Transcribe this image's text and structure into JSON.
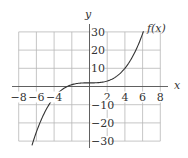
{
  "chart_data": {
    "type": "line",
    "title": "",
    "xlabel": "x",
    "ylabel": "y",
    "xlim": [
      -8,
      8
    ],
    "ylim": [
      -30,
      30
    ],
    "grid": true,
    "x_ticks": [
      -8,
      -6,
      -4,
      2,
      4,
      6,
      8
    ],
    "x_tick_labels": [
      "−8",
      "−6",
      "−4",
      "2",
      "4",
      "6",
      "8"
    ],
    "y_ticks": [
      30,
      20,
      10,
      -10,
      -20,
      -30
    ],
    "y_tick_labels": [
      "30",
      "20",
      "10",
      "−10",
      "−20",
      "−30"
    ],
    "series": [
      {
        "name": "f(x)",
        "x": [
          -6.5,
          -6,
          -5,
          -4,
          -3,
          -2,
          -1,
          0,
          1,
          2,
          3,
          4,
          5,
          6,
          6.1
        ],
        "values": [
          -32.3,
          -25,
          -13.6,
          -6,
          -1.4,
          1,
          1.9,
          2,
          2.1,
          3,
          5.4,
          10,
          17.6,
          29,
          30.4
        ]
      }
    ],
    "legend": [],
    "annotations": [
      {
        "text": "f(x)",
        "position": "end of curve, upper right"
      }
    ]
  },
  "labels": {
    "x_axis": "x",
    "y_axis": "y",
    "curve": "f(x)"
  }
}
